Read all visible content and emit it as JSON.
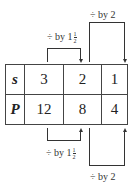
{
  "table": {
    "rows": [
      {
        "header": "s",
        "values": [
          "3",
          "2",
          "1"
        ]
      },
      {
        "header": "P",
        "values": [
          "12",
          "8",
          "4"
        ]
      }
    ]
  },
  "annotations": {
    "top": [
      {
        "op": "÷",
        "text": "by 1",
        "frac_num": "1",
        "frac_den": "2"
      },
      {
        "op": "÷",
        "text": "by 2"
      }
    ],
    "bottom": [
      {
        "op": "÷",
        "text": "by 1",
        "frac_num": "1",
        "frac_den": "2"
      },
      {
        "op": "÷",
        "text": "by 2"
      }
    ]
  }
}
